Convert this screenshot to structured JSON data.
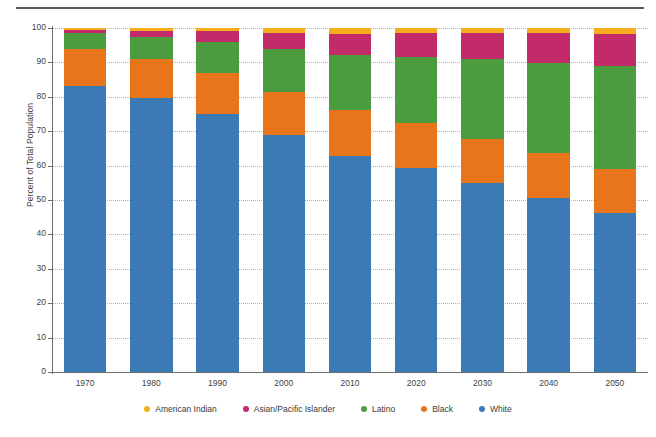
{
  "chart_data": {
    "type": "bar",
    "stacked": true,
    "title": "",
    "xlabel": "",
    "ylabel": "Percent of Total Population",
    "ylim": [
      0,
      100
    ],
    "ytick_labels": [
      "0",
      "10",
      "20",
      "30",
      "40",
      "50",
      "60",
      "70",
      "80",
      "90",
      "100"
    ],
    "ytick_values": [
      0,
      10,
      20,
      30,
      40,
      50,
      60,
      70,
      80,
      90,
      100
    ],
    "grid": true,
    "legend_position": "bottom",
    "categories": [
      "1970",
      "1980",
      "1990",
      "2000",
      "2010",
      "2020",
      "2030",
      "2040",
      "2050"
    ],
    "series": [
      {
        "name": "White",
        "color": "#3b7ab5",
        "values": [
          83.0,
          79.6,
          75.0,
          69.0,
          62.8,
          59.4,
          55.0,
          50.6,
          46.3
        ]
      },
      {
        "name": "Black",
        "color": "#e8741c",
        "values": [
          11.0,
          11.4,
          12.0,
          12.5,
          13.4,
          13.0,
          12.8,
          13.0,
          12.8
        ]
      },
      {
        "name": "Latino",
        "color": "#4a9c3e",
        "values": [
          4.5,
          6.5,
          9.0,
          12.5,
          16.0,
          19.1,
          23.2,
          26.3,
          29.9
        ]
      },
      {
        "name": "Asian/Pacific Islander",
        "color": "#c32a6a",
        "values": [
          0.8,
          1.6,
          3.0,
          4.5,
          6.2,
          7.0,
          7.7,
          8.6,
          9.3
        ]
      },
      {
        "name": "American Indian",
        "color": "#f5ad1e",
        "values": [
          0.7,
          0.9,
          1.0,
          1.5,
          1.6,
          1.5,
          1.3,
          1.5,
          1.7
        ]
      }
    ]
  },
  "axis": {
    "y_title": "Percent of Total Population"
  },
  "legend": {
    "items": [
      {
        "label": "American Indian",
        "color": "#f5ad1e"
      },
      {
        "label": "Asian/Pacific Islander",
        "color": "#c32a6a"
      },
      {
        "label": "Latino",
        "color": "#4a9c3e"
      },
      {
        "label": "Black",
        "color": "#e8741c"
      },
      {
        "label": "White",
        "color": "#3b7ab5"
      }
    ]
  }
}
